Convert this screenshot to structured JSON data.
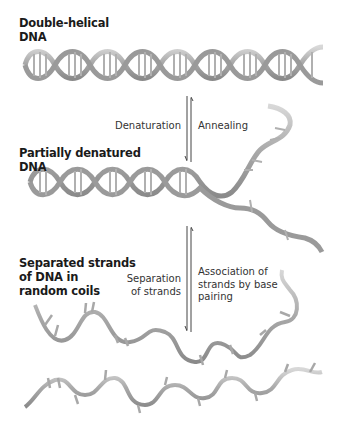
{
  "labels": {
    "double_helical": [
      "Double-helical",
      "DNA"
    ],
    "partially_denatured": [
      "Partially denatured",
      "DNA"
    ],
    "separated": [
      "Separated strands",
      "of DNA in",
      "random coils"
    ]
  },
  "arrows": {
    "top": {
      "forward": "Denaturation",
      "reverse": "Annealing"
    },
    "bottom": {
      "forward": [
        "Separation",
        "of strands"
      ],
      "reverse": [
        "Association of",
        "strands by base",
        "pairing"
      ]
    }
  },
  "colors": {
    "strand": "#b8b8b8",
    "strand_dark": "#8c8c8c",
    "text": "#1a1a1a",
    "arrow": "#444444"
  }
}
